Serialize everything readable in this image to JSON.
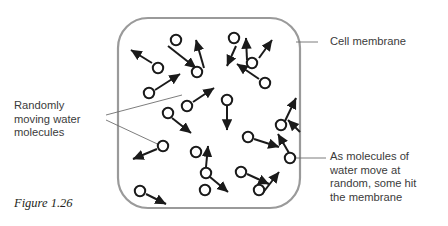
{
  "figure": {
    "caption": "Figure 1.26"
  },
  "labels": {
    "randomly_moving": "Randomly\nmoving water\nmolecules",
    "cell_membrane": "Cell membrane",
    "molecules_hit": "As molecules of\nwater move at\nrandom, some hit\nthe membrane"
  },
  "colors": {
    "membrane_stroke": "#9a9a9a",
    "molecule_stroke": "#1a1a1a",
    "arrow_stroke": "#1a1a1a",
    "leader_stroke": "#6e6e6e",
    "text": "#3b3b3b",
    "caption_text": "#231f20",
    "background": "#ffffff"
  },
  "diagram": {
    "type": "schematic",
    "cell": {
      "shape": "rounded-square",
      "x": 118,
      "y": 18,
      "width": 182,
      "height": 190,
      "corner_radius": 30,
      "stroke_width": 2.2
    },
    "molecule_radius": 5.2,
    "molecules": [
      {
        "x": 176,
        "y": 40
      },
      {
        "x": 234,
        "y": 38
      },
      {
        "x": 158,
        "y": 68
      },
      {
        "x": 197,
        "y": 72
      },
      {
        "x": 252,
        "y": 63
      },
      {
        "x": 265,
        "y": 83
      },
      {
        "x": 149,
        "y": 93
      },
      {
        "x": 187,
        "y": 106
      },
      {
        "x": 168,
        "y": 113
      },
      {
        "x": 227,
        "y": 100
      },
      {
        "x": 281,
        "y": 125
      },
      {
        "x": 248,
        "y": 137
      },
      {
        "x": 163,
        "y": 146
      },
      {
        "x": 206,
        "y": 173
      },
      {
        "x": 205,
        "y": 190
      },
      {
        "x": 241,
        "y": 172
      },
      {
        "x": 259,
        "y": 190
      },
      {
        "x": 140,
        "y": 191
      },
      {
        "x": 290,
        "y": 158
      },
      {
        "x": 196,
        "y": 152
      }
    ],
    "arrows": [
      {
        "x1": 168,
        "y1": 46,
        "x2": 196,
        "y2": 68
      },
      {
        "x1": 152,
        "y1": 63,
        "x2": 131,
        "y2": 50
      },
      {
        "x1": 204,
        "y1": 68,
        "x2": 196,
        "y2": 40
      },
      {
        "x1": 236,
        "y1": 46,
        "x2": 227,
        "y2": 66
      },
      {
        "x1": 259,
        "y1": 58,
        "x2": 272,
        "y2": 40
      },
      {
        "x1": 247,
        "y1": 60,
        "x2": 246,
        "y2": 38
      },
      {
        "x1": 155,
        "y1": 90,
        "x2": 180,
        "y2": 74
      },
      {
        "x1": 259,
        "y1": 79,
        "x2": 237,
        "y2": 64
      },
      {
        "x1": 193,
        "y1": 102,
        "x2": 214,
        "y2": 88
      },
      {
        "x1": 172,
        "y1": 118,
        "x2": 191,
        "y2": 133
      },
      {
        "x1": 227,
        "y1": 106,
        "x2": 227,
        "y2": 130
      },
      {
        "x1": 285,
        "y1": 121,
        "x2": 296,
        "y2": 98
      },
      {
        "x1": 254,
        "y1": 139,
        "x2": 279,
        "y2": 147
      },
      {
        "x1": 157,
        "y1": 149,
        "x2": 133,
        "y2": 159
      },
      {
        "x1": 206,
        "y1": 167,
        "x2": 208,
        "y2": 146
      },
      {
        "x1": 210,
        "y1": 177,
        "x2": 228,
        "y2": 192
      },
      {
        "x1": 247,
        "y1": 174,
        "x2": 269,
        "y2": 184
      },
      {
        "x1": 146,
        "y1": 194,
        "x2": 166,
        "y2": 204
      },
      {
        "x1": 262,
        "y1": 194,
        "x2": 279,
        "y2": 172
      },
      {
        "x1": 289,
        "y1": 153,
        "x2": 278,
        "y2": 134
      },
      {
        "x1": 300,
        "y1": 132,
        "x2": 288,
        "y2": 120
      }
    ],
    "leaders": [
      {
        "name": "membrane-leader",
        "points": "318,42 296,42"
      },
      {
        "name": "hit-leader",
        "points": "326,158 291,158"
      },
      {
        "name": "randomly-leader-upper",
        "points": "106,115 182,95"
      },
      {
        "name": "randomly-leader-lower",
        "points": "106,120 166,148"
      }
    ]
  }
}
